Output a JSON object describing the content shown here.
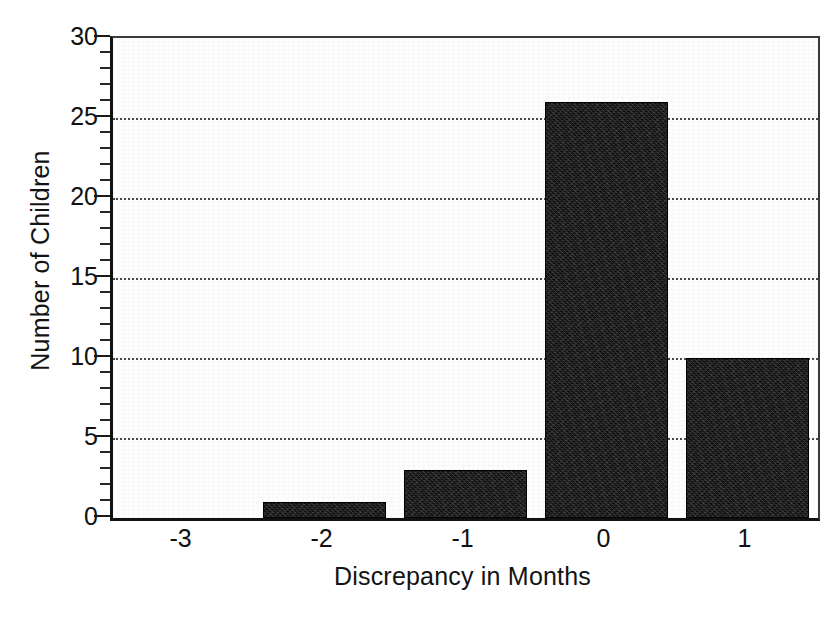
{
  "chart_data": {
    "type": "bar",
    "title": "",
    "subtitle": "",
    "xlabel": "Discrepancy in Months",
    "ylabel": "Number of Children",
    "categories": [
      "-3",
      "-2",
      "-1",
      "0",
      "1"
    ],
    "values": [
      0,
      1,
      3,
      26,
      10
    ],
    "series": [
      {
        "name": "Number of Children",
        "values": [
          0,
          1,
          3,
          26,
          10
        ]
      }
    ],
    "ylim": [
      0,
      30
    ],
    "y_major_ticks": [
      0,
      5,
      10,
      15,
      20,
      25,
      30
    ],
    "y_tick_labels": [
      "0",
      "5",
      "10",
      "15",
      "20",
      "25",
      "30"
    ],
    "y_minor_tick_interval": 1,
    "x_tick_labels": [
      "-3",
      "-2",
      "-1",
      "0",
      "1"
    ],
    "grid": "horizontal-dotted-major",
    "legend": "none",
    "bar_color": "#111111",
    "background_color": "#ffffff",
    "plot_background_color": "#fdfdfd",
    "axis_color": "#111111",
    "gridline_color": "#4a4a4a"
  }
}
